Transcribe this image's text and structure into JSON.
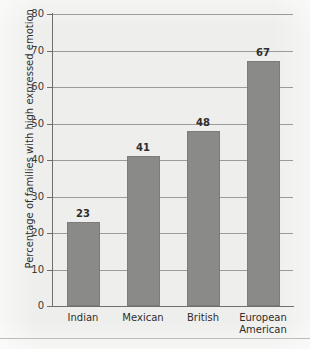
{
  "chart_data": {
    "type": "bar",
    "title": "",
    "xlabel": "",
    "ylabel": "Percentage of families with high expressed emotion",
    "categories": [
      "Indian",
      "Mexican",
      "British",
      "European American"
    ],
    "category_lines": [
      [
        "Indian"
      ],
      [
        "Mexican"
      ],
      [
        "British"
      ],
      [
        "European",
        "American"
      ]
    ],
    "values": [
      23,
      41,
      48,
      67
    ],
    "value_labels": [
      "23",
      "41",
      "48",
      "67"
    ],
    "ylim": [
      0,
      80
    ],
    "yticks": [
      0,
      10,
      20,
      30,
      40,
      50,
      60,
      70,
      80
    ],
    "ytick_labels": [
      "0",
      "10",
      "20",
      "30",
      "40",
      "50",
      "60",
      "70",
      "80"
    ],
    "grid": true,
    "grid_axis": "y",
    "legend": null,
    "legend_position": "none",
    "colors": {
      "bar_fill": "#8a8a88",
      "bar_edge": "#7c7c7a",
      "gridline": "#9b9b97",
      "axis": "#6f6f6b",
      "background": "#eeeeec",
      "text": "#2e2e2c"
    }
  }
}
